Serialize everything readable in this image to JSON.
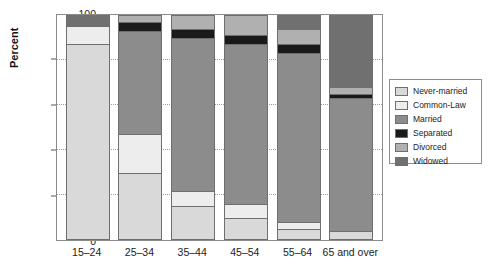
{
  "chart_data": {
    "type": "bar",
    "subtype": "stacked-percentage",
    "title": "",
    "xlabel": "",
    "ylabel": "Percent",
    "ylim": [
      0,
      100
    ],
    "yticks": [
      0,
      20,
      40,
      60,
      80,
      100
    ],
    "grid": true,
    "legend_position": "right",
    "categories": [
      "15–24",
      "25–34",
      "35–44",
      "45–54",
      "55–64",
      "65 and over"
    ],
    "series": [
      {
        "name": "Never-married",
        "color": "#d9d9d9",
        "values": [
          87,
          30,
          15,
          10,
          5,
          4
        ]
      },
      {
        "name": "Common-Law",
        "color": "#ededed",
        "values": [
          8,
          17,
          7,
          6,
          3,
          0
        ]
      },
      {
        "name": "Married",
        "color": "#8c8c8c",
        "values": [
          0,
          46,
          68,
          71,
          75,
          59
        ]
      },
      {
        "name": "Separated",
        "color": "#1a1a1a",
        "values": [
          0,
          4,
          4,
          4,
          4,
          2
        ]
      },
      {
        "name": "Divorced",
        "color": "#b0b0b0",
        "values": [
          0,
          3,
          6,
          9,
          7,
          3
        ]
      },
      {
        "name": "Widowed",
        "color": "#707070",
        "values": [
          5,
          0,
          0,
          0,
          6,
          32
        ]
      }
    ]
  },
  "legend": {
    "items": [
      {
        "label": "Never-married"
      },
      {
        "label": "Common-Law"
      },
      {
        "label": "Married"
      },
      {
        "label": "Separated"
      },
      {
        "label": "Divorced"
      },
      {
        "label": "Widowed"
      }
    ]
  },
  "axes": {
    "y_title": "Percent"
  }
}
